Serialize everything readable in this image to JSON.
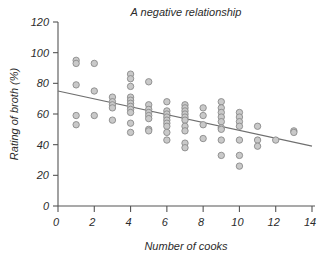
{
  "chart_data": {
    "type": "scatter",
    "title": "A negative relationship",
    "xlabel": "Number of cooks",
    "ylabel": "Rating of broth (%)",
    "xlim": [
      0,
      14
    ],
    "ylim": [
      0,
      120
    ],
    "xticks": [
      0,
      2,
      4,
      6,
      8,
      10,
      12,
      14
    ],
    "yticks": [
      0,
      20,
      40,
      60,
      80,
      100,
      120
    ],
    "xtick_labels": [
      "0",
      "2",
      "4",
      "6",
      "8",
      "10",
      "12",
      "14"
    ],
    "ytick_labels": [
      "0",
      "20",
      "40",
      "60",
      "80",
      "100",
      "120"
    ],
    "grid": false,
    "legend": null,
    "marker": {
      "shape": "circle",
      "fill_color": "#c9c9c9",
      "edge_color": "#8a8a8a",
      "radius_px": 3.2
    },
    "trendline": {
      "name": "linear fit",
      "color": "#6f6f6f",
      "x": [
        0,
        14
      ],
      "y": [
        75,
        39
      ],
      "intercept": 75,
      "slope": -2.571
    },
    "points": [
      {
        "x": 1,
        "y": 95
      },
      {
        "x": 1,
        "y": 93
      },
      {
        "x": 1,
        "y": 79
      },
      {
        "x": 1,
        "y": 59
      },
      {
        "x": 1,
        "y": 53
      },
      {
        "x": 2,
        "y": 93
      },
      {
        "x": 2,
        "y": 75
      },
      {
        "x": 2,
        "y": 59
      },
      {
        "x": 3,
        "y": 71
      },
      {
        "x": 3,
        "y": 68
      },
      {
        "x": 3,
        "y": 66
      },
      {
        "x": 3,
        "y": 64
      },
      {
        "x": 3,
        "y": 56
      },
      {
        "x": 4,
        "y": 86
      },
      {
        "x": 4,
        "y": 83
      },
      {
        "x": 4,
        "y": 78
      },
      {
        "x": 4,
        "y": 71
      },
      {
        "x": 4,
        "y": 69
      },
      {
        "x": 4,
        "y": 67
      },
      {
        "x": 4,
        "y": 65
      },
      {
        "x": 4,
        "y": 63
      },
      {
        "x": 4,
        "y": 61
      },
      {
        "x": 4,
        "y": 54
      },
      {
        "x": 4,
        "y": 48
      },
      {
        "x": 5,
        "y": 81
      },
      {
        "x": 5,
        "y": 66
      },
      {
        "x": 5,
        "y": 63
      },
      {
        "x": 5,
        "y": 61
      },
      {
        "x": 5,
        "y": 59
      },
      {
        "x": 5,
        "y": 57
      },
      {
        "x": 5,
        "y": 50
      },
      {
        "x": 5,
        "y": 49
      },
      {
        "x": 6,
        "y": 68
      },
      {
        "x": 6,
        "y": 62
      },
      {
        "x": 6,
        "y": 60
      },
      {
        "x": 6,
        "y": 58
      },
      {
        "x": 6,
        "y": 56
      },
      {
        "x": 6,
        "y": 54
      },
      {
        "x": 6,
        "y": 52
      },
      {
        "x": 6,
        "y": 48
      },
      {
        "x": 6,
        "y": 43
      },
      {
        "x": 7,
        "y": 66
      },
      {
        "x": 7,
        "y": 64
      },
      {
        "x": 7,
        "y": 62
      },
      {
        "x": 7,
        "y": 60
      },
      {
        "x": 7,
        "y": 58
      },
      {
        "x": 7,
        "y": 56
      },
      {
        "x": 7,
        "y": 52
      },
      {
        "x": 7,
        "y": 49
      },
      {
        "x": 7,
        "y": 41
      },
      {
        "x": 7,
        "y": 38
      },
      {
        "x": 8,
        "y": 64
      },
      {
        "x": 8,
        "y": 59
      },
      {
        "x": 8,
        "y": 53
      },
      {
        "x": 8,
        "y": 44
      },
      {
        "x": 9,
        "y": 68
      },
      {
        "x": 9,
        "y": 64
      },
      {
        "x": 9,
        "y": 61
      },
      {
        "x": 9,
        "y": 58
      },
      {
        "x": 9,
        "y": 55
      },
      {
        "x": 9,
        "y": 51
      },
      {
        "x": 9,
        "y": 50
      },
      {
        "x": 9,
        "y": 43
      },
      {
        "x": 9,
        "y": 33
      },
      {
        "x": 10,
        "y": 61
      },
      {
        "x": 10,
        "y": 58
      },
      {
        "x": 10,
        "y": 55
      },
      {
        "x": 10,
        "y": 52
      },
      {
        "x": 10,
        "y": 43
      },
      {
        "x": 10,
        "y": 33
      },
      {
        "x": 10,
        "y": 26
      },
      {
        "x": 11,
        "y": 52
      },
      {
        "x": 11,
        "y": 43
      },
      {
        "x": 11,
        "y": 39
      },
      {
        "x": 12,
        "y": 43
      },
      {
        "x": 13,
        "y": 49
      },
      {
        "x": 13,
        "y": 48
      }
    ]
  }
}
